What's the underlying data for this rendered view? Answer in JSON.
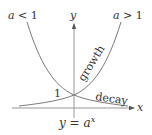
{
  "diagram": {
    "caption": {
      "y": "y",
      "eq": " = ",
      "a": "a",
      "exp": "x"
    },
    "axes": {
      "x_label": "x",
      "y_label": "y"
    },
    "intercept_label": "1",
    "curves": [
      {
        "name": "growth",
        "label": "growth",
        "condition_var": "a",
        "condition_op": " > ",
        "condition_val": "1"
      },
      {
        "name": "decay",
        "label": "decay",
        "condition_var": "a",
        "condition_op": " < ",
        "condition_val": "1"
      }
    ],
    "colors": {
      "curve": "#7a7a7a",
      "axis": "#7a7a7a",
      "text": "#333333"
    }
  }
}
